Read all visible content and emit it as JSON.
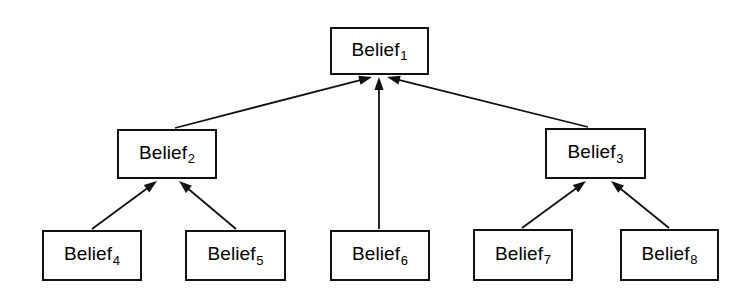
{
  "diagram": {
    "type": "directed-graph",
    "background_color": "#ffffff",
    "stroke_color": "#111111",
    "text_color": "#000000",
    "nodes": [
      {
        "id": "belief-1",
        "base": "Belief",
        "subscript": "1",
        "x": 330,
        "y": 27,
        "width": 99,
        "height": 48
      },
      {
        "id": "belief-2",
        "base": "Belief",
        "subscript": "2",
        "x": 117,
        "y": 129,
        "width": 100,
        "height": 50
      },
      {
        "id": "belief-3",
        "base": "Belief",
        "subscript": "3",
        "x": 545,
        "y": 128,
        "width": 101,
        "height": 51
      },
      {
        "id": "belief-4",
        "base": "Belief",
        "subscript": "4",
        "x": 42,
        "y": 230,
        "width": 100,
        "height": 51
      },
      {
        "id": "belief-5",
        "base": "Belief",
        "subscript": "5",
        "x": 185,
        "y": 230,
        "width": 101,
        "height": 51
      },
      {
        "id": "belief-6",
        "base": "Belief",
        "subscript": "6",
        "x": 330,
        "y": 230,
        "width": 100,
        "height": 51
      },
      {
        "id": "belief-7",
        "base": "Belief",
        "subscript": "7",
        "x": 473,
        "y": 229,
        "width": 100,
        "height": 52
      },
      {
        "id": "belief-8",
        "base": "Belief",
        "subscript": "8",
        "x": 620,
        "y": 229,
        "width": 99,
        "height": 52
      }
    ],
    "edges": [
      {
        "id": "edge-belief2-to-belief1",
        "from": "belief-2",
        "to": "belief-1",
        "x1": 175,
        "y1": 128,
        "x2": 372,
        "y2": 77
      },
      {
        "id": "edge-belief6-to-belief1",
        "from": "belief-6",
        "to": "belief-1",
        "x1": 379,
        "y1": 229,
        "x2": 379,
        "y2": 77
      },
      {
        "id": "edge-belief3-to-belief1",
        "from": "belief-3",
        "to": "belief-1",
        "x1": 588,
        "y1": 127,
        "x2": 387,
        "y2": 77
      },
      {
        "id": "edge-belief4-to-belief2",
        "from": "belief-4",
        "to": "belief-2",
        "x1": 92,
        "y1": 229,
        "x2": 157,
        "y2": 181
      },
      {
        "id": "edge-belief5-to-belief2",
        "from": "belief-5",
        "to": "belief-2",
        "x1": 236,
        "y1": 229,
        "x2": 179,
        "y2": 181
      },
      {
        "id": "edge-belief7-to-belief3",
        "from": "belief-7",
        "to": "belief-3",
        "x1": 522,
        "y1": 228,
        "x2": 586,
        "y2": 181
      },
      {
        "id": "edge-belief8-to-belief3",
        "from": "belief-8",
        "to": "belief-3",
        "x1": 669,
        "y1": 228,
        "x2": 611,
        "y2": 181
      }
    ]
  }
}
